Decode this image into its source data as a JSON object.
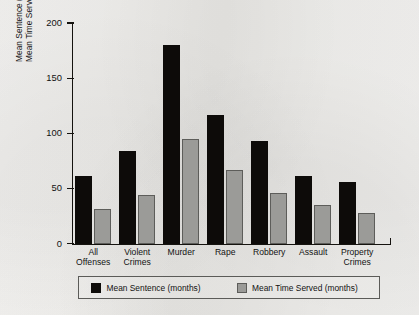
{
  "chart_data": {
    "type": "bar",
    "title": "",
    "subtitle": "",
    "xlabel": "",
    "ylabel_line1": "Mean Sentence (months) vs.",
    "ylabel_line2": "Mean Time Served (months)",
    "categories": [
      {
        "line1": "All",
        "line2": "Offenses"
      },
      {
        "line1": "Violent",
        "line2": "Crimes"
      },
      {
        "line1": "Murder",
        "line2": ""
      },
      {
        "line1": "Rape",
        "line2": ""
      },
      {
        "line1": "Robbery",
        "line2": ""
      },
      {
        "line1": "Assault",
        "line2": ""
      },
      {
        "line1": "Property",
        "line2": "Crimes"
      }
    ],
    "series": [
      {
        "name": "Mean Sentence (months)",
        "color": "#0d0b09",
        "values": [
          61,
          84,
          180,
          117,
          93,
          61,
          56
        ]
      },
      {
        "name": "Mean Time Served (months)",
        "color": "#9b9b98",
        "values": [
          31,
          44,
          95,
          67,
          46,
          35,
          28
        ]
      }
    ],
    "ylim": [
      0,
      200
    ],
    "yticks": [
      0,
      50,
      100,
      150,
      200
    ],
    "ytick_labels": [
      "0",
      "50",
      "100",
      "150",
      "200"
    ],
    "grid": false,
    "legend_position": "bottom",
    "axis_frame": "left-and-bottom"
  },
  "legend": {
    "entries": [
      {
        "label": "Mean Sentence (months)",
        "swatch": "black-square"
      },
      {
        "label": "Mean Time Served (months)",
        "swatch": "gray-square"
      }
    ]
  },
  "colors": {
    "background": "#f2f1ef",
    "axis": "#15130f",
    "series_sentence": "#0d0b09",
    "series_served": "#9b9b98",
    "text": "#121212"
  }
}
